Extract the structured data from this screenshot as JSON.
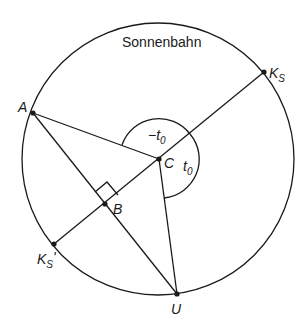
{
  "diagram": {
    "title": "Sonnenbahn",
    "circle": {
      "cx": 158,
      "cy": 159,
      "r": 136
    },
    "points": {
      "A": {
        "label": "A",
        "x": 33,
        "y": 113
      },
      "KS": {
        "label": "K",
        "sub": "S",
        "x": 264,
        "y": 72
      },
      "KSprime": {
        "label": "K",
        "sub": "S",
        "prime": "'",
        "x": 54,
        "y": 244
      },
      "C": {
        "label": "C",
        "x": 159,
        "y": 159
      },
      "B": {
        "label": "B",
        "x": 105,
        "y": 204
      },
      "U": {
        "label": "U",
        "x": 177,
        "y": 294
      }
    },
    "angles": {
      "neg_t0": {
        "prefix": "−t",
        "sub": "0"
      },
      "t0": {
        "prefix": "t",
        "sub": "0"
      }
    }
  }
}
